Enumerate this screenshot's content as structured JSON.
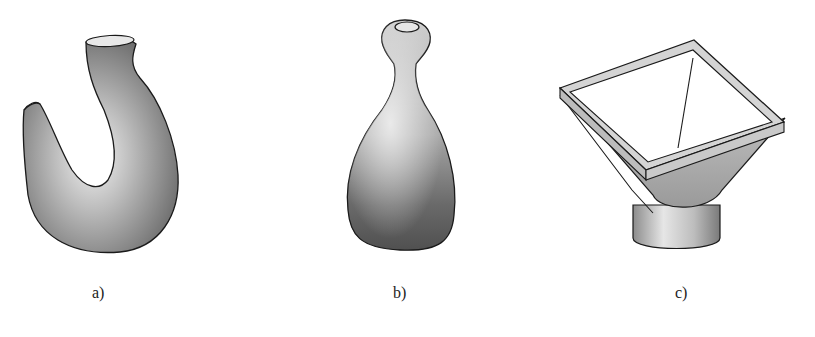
{
  "figure": {
    "panels": [
      {
        "id": "a",
        "label": "a)",
        "subject": "crane-hook"
      },
      {
        "id": "b",
        "label": "b)",
        "subject": "bottle"
      },
      {
        "id": "c",
        "label": "c)",
        "subject": "square-to-round-transition-hopper"
      }
    ],
    "colors": {
      "background": "#ffffff",
      "outline": "#1a1a1a",
      "shade_dark": "#555555",
      "shade_mid": "#9a9a9a",
      "shade_light": "#e8e8e8"
    }
  }
}
